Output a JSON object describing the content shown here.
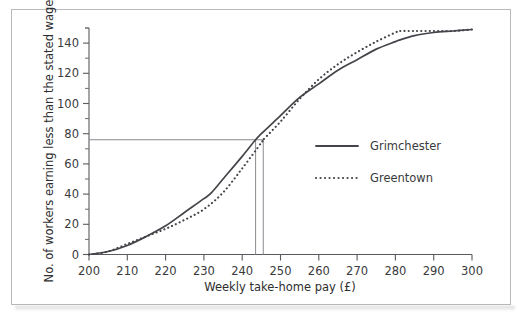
{
  "chart_data": {
    "type": "line",
    "title": "",
    "xlabel": "Weekly take-home pay (£)",
    "ylabel": "No. of workers earning less than the stated wage",
    "xlim": [
      200,
      300
    ],
    "ylim": [
      0,
      150
    ],
    "xticks": [
      200,
      210,
      220,
      230,
      240,
      250,
      260,
      270,
      280,
      290,
      300
    ],
    "xtick_labels": [
      "200",
      "210",
      "220",
      "230",
      "240",
      "250",
      "260",
      "270",
      "280",
      "290",
      "300"
    ],
    "yticks": [
      0,
      20,
      40,
      60,
      80,
      100,
      120,
      140
    ],
    "ytick_labels": [
      "0",
      "20",
      "40",
      "60",
      "80",
      "100",
      "120",
      "140"
    ],
    "yminor_step": 10,
    "grid": false,
    "legend_position": "center-right",
    "series": [
      {
        "name": "Grimchester",
        "style": "solid",
        "color": "#44444a",
        "x": [
          200,
          205,
          210,
          215,
          220,
          225,
          230,
          232,
          235,
          240,
          243.5,
          245,
          250,
          255,
          260,
          265,
          270,
          275,
          280,
          281,
          285,
          290,
          295,
          300
        ],
        "values": [
          0,
          2,
          6,
          12,
          19,
          28,
          37,
          41,
          50,
          65,
          76,
          80,
          92,
          104,
          113,
          122,
          129,
          136,
          141,
          142,
          145,
          147,
          148,
          149
        ]
      },
      {
        "name": "Greentown",
        "style": "dotted",
        "color": "#44444a",
        "x": [
          200,
          205,
          210,
          215,
          220,
          225,
          230,
          235,
          240,
          245,
          245.5,
          250,
          255,
          260,
          265,
          270,
          275,
          280,
          281,
          285,
          290,
          295,
          300
        ],
        "values": [
          0,
          2,
          7,
          12,
          17,
          23,
          30,
          41,
          57,
          74,
          76,
          88,
          103,
          116,
          126,
          134,
          141,
          147,
          148,
          148,
          148,
          148,
          149
        ]
      }
    ],
    "annotations": [
      {
        "name": "median-horizontal-line",
        "type": "hline",
        "y": 76,
        "x_from": 200,
        "x_to": 245.5,
        "color": "#8a8a90"
      },
      {
        "name": "median-grimchester-line",
        "type": "vline",
        "x": 243.5,
        "y_from": 0,
        "y_to": 76,
        "color": "#8a8a90"
      },
      {
        "name": "median-greentown-line",
        "type": "vline",
        "x": 245.5,
        "y_from": 0,
        "y_to": 76,
        "color": "#8a8a90"
      }
    ]
  },
  "legend": {
    "items": [
      {
        "label": "Grimchester",
        "style": "solid"
      },
      {
        "label": "Greentown",
        "style": "dotted"
      }
    ]
  },
  "axes": {
    "x_title": "Weekly take-home pay (£)",
    "y_title": "No. of workers earning less than the stated wage"
  }
}
